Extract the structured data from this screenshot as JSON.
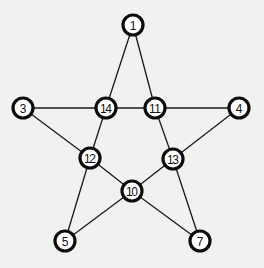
{
  "diagram": {
    "type": "graph",
    "colors": {
      "background": "#f1f1ef",
      "node_fill": "#ffffff",
      "node_stroke": "#0d0d0d",
      "edge": "#1a1a1a",
      "text": "#111111"
    },
    "nodes": [
      {
        "id": "1",
        "label": "1",
        "x": 133,
        "y": 25
      },
      {
        "id": "3",
        "label": "3",
        "x": 23,
        "y": 108
      },
      {
        "id": "14",
        "label": "14",
        "x": 106,
        "y": 108
      },
      {
        "id": "11",
        "label": "11",
        "x": 155,
        "y": 108
      },
      {
        "id": "4",
        "label": "4",
        "x": 239,
        "y": 108
      },
      {
        "id": "12",
        "label": "12",
        "x": 90,
        "y": 158
      },
      {
        "id": "13",
        "label": "13",
        "x": 173,
        "y": 159
      },
      {
        "id": "10",
        "label": "10",
        "x": 132,
        "y": 191
      },
      {
        "id": "5",
        "label": "5",
        "x": 65,
        "y": 241
      },
      {
        "id": "7",
        "label": "7",
        "x": 200,
        "y": 241
      }
    ],
    "edges": [
      [
        "1",
        "14"
      ],
      [
        "1",
        "11"
      ],
      [
        "3",
        "14"
      ],
      [
        "14",
        "11"
      ],
      [
        "11",
        "4"
      ],
      [
        "3",
        "12"
      ],
      [
        "14",
        "12"
      ],
      [
        "11",
        "13"
      ],
      [
        "4",
        "13"
      ],
      [
        "12",
        "10"
      ],
      [
        "13",
        "10"
      ],
      [
        "12",
        "5"
      ],
      [
        "13",
        "7"
      ],
      [
        "10",
        "5"
      ],
      [
        "10",
        "7"
      ]
    ]
  }
}
